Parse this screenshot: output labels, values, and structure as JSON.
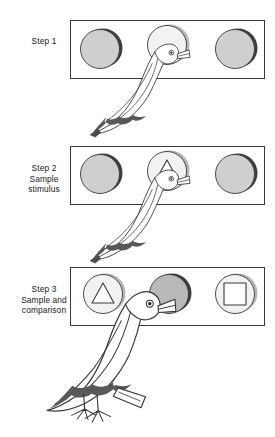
{
  "figure": {
    "background_color": "#ffffff",
    "line_color": "#3a3a3a",
    "key_fill_lit": "#f2f2f2",
    "key_fill_gray": "#cfcfcf",
    "key_fill_dark": "#b9b9b9",
    "key_shadow_color": "#3d3d3d",
    "panel_border_color": "#3a3a3a",
    "bird_marking_color": "#595959"
  },
  "steps": [
    {
      "id": "step-1",
      "label_lines": [
        "Step 1"
      ],
      "line1": "Step 1",
      "line2": "",
      "line3": "",
      "panel": {
        "keys": [
          {
            "position": "left",
            "state": "gray",
            "symbol": "none",
            "lit": false
          },
          {
            "position": "center",
            "state": "lit",
            "symbol": "none",
            "lit": true
          },
          {
            "position": "right",
            "state": "gray",
            "symbol": "none",
            "lit": false
          }
        ]
      },
      "bird": {
        "pose": "pecking-center-key",
        "legs_visible": false
      }
    },
    {
      "id": "step-2",
      "label_lines": [
        "Step 2",
        "Sample",
        "stimulus"
      ],
      "line1": "Step 2",
      "line2": "Sample",
      "line3": "stimulus",
      "panel": {
        "keys": [
          {
            "position": "left",
            "state": "gray",
            "symbol": "none",
            "lit": false
          },
          {
            "position": "center",
            "state": "lit",
            "symbol": "triangle",
            "lit": true
          },
          {
            "position": "right",
            "state": "gray",
            "symbol": "none",
            "lit": false
          }
        ]
      },
      "bird": {
        "pose": "pecking-center-key",
        "legs_visible": false
      }
    },
    {
      "id": "step-3",
      "label_lines": [
        "Step 3",
        "Sample and",
        "comparison"
      ],
      "line1": "Step 3",
      "line2": "Sample and",
      "line3": "comparison",
      "panel": {
        "keys": [
          {
            "position": "left",
            "state": "lit",
            "symbol": "triangle",
            "lit": true
          },
          {
            "position": "center",
            "state": "dark",
            "symbol": "none",
            "lit": false
          },
          {
            "position": "right",
            "state": "lit",
            "symbol": "square",
            "lit": true
          }
        ]
      },
      "bird": {
        "pose": "standing-pecking-left-key",
        "legs_visible": true
      }
    }
  ]
}
